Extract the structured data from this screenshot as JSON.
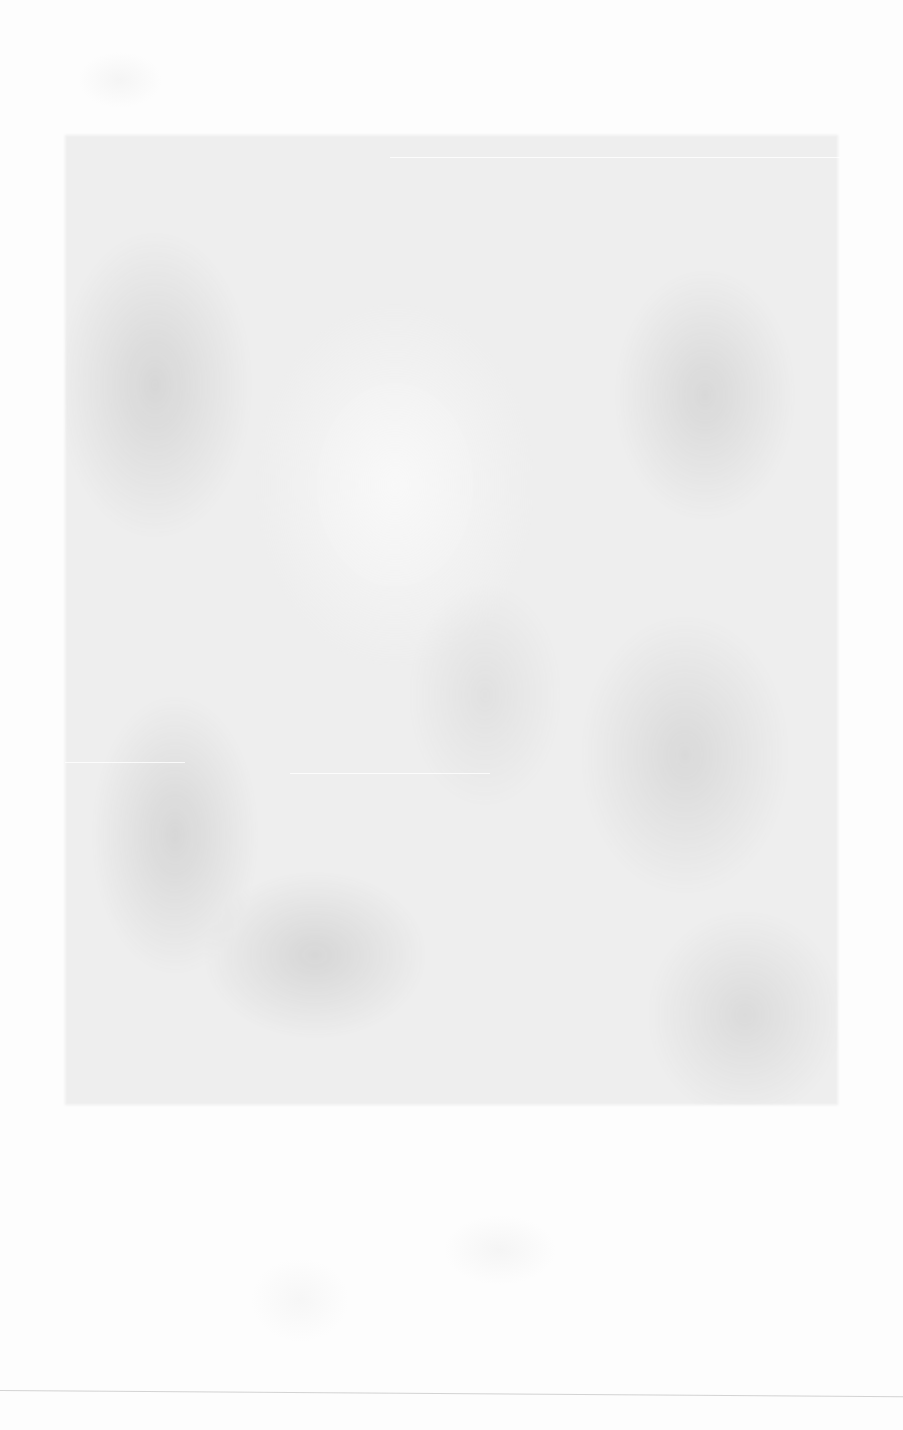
{
  "page": {
    "width": 903,
    "height": 1430,
    "background_color": "#fdfdfd",
    "mottled_region": {
      "x": 65,
      "y": 135,
      "width": 773,
      "height": 970,
      "tint_color": "#e1e1e1"
    }
  }
}
